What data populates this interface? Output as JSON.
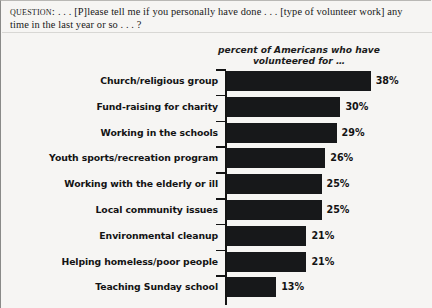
{
  "question": {
    "label": "Question:",
    "line1": " . . . [P]lease tell me if you personally have done . . . [type of volunteer",
    "line2": "work] any time in the last year or so . . . ?"
  },
  "chart_data": {
    "type": "bar",
    "orientation": "horizontal",
    "title": "",
    "subtitle": "percent of Americans who have volunteered for …",
    "subtitle_line1": "percent of Americans who have",
    "subtitle_line2": "volunteered for …",
    "xlabel": "",
    "ylabel": "",
    "xlim": [
      0,
      40
    ],
    "grid": false,
    "legend": false,
    "bar_color": "#17181a",
    "categories": [
      "Church/religious group",
      "Fund-raising for charity",
      "Working in the schools",
      "Youth sports/recreation program",
      "Working with the elderly or ill",
      "Local community issues",
      "Environmental cleanup",
      "Helping homeless/poor people",
      "Teaching Sunday school"
    ],
    "values": [
      38,
      30,
      29,
      26,
      25,
      25,
      21,
      21,
      13
    ],
    "value_labels": [
      "38%",
      "30%",
      "29%",
      "26%",
      "25%",
      "25%",
      "21%",
      "21%",
      "13%"
    ]
  }
}
